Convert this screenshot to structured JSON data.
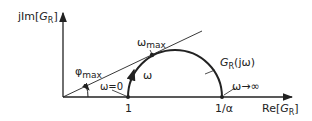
{
  "diagram": {
    "axes": {
      "y_label_prefix": "jIm[",
      "y_label_var": "G",
      "y_label_sub": "R",
      "y_label_suffix": "]",
      "x_label_prefix": "Re[",
      "x_label_var": "G",
      "x_label_sub": "R",
      "x_label_suffix": "]"
    },
    "points": {
      "start_tick": "1",
      "end_tick": "1/α"
    },
    "labels": {
      "phi_max_main": "φ",
      "phi_max_sub": "max",
      "omega_zero": "ω=0",
      "omega_max_main": "ω",
      "omega_max_sub": "max",
      "omega_dir": "ω",
      "curve_main": "G",
      "curve_sub": "R",
      "curve_arg": "(jω)",
      "omega_inf": "ω→∞"
    },
    "colors": {
      "ink": "#222222",
      "background": "#ffffff"
    }
  }
}
